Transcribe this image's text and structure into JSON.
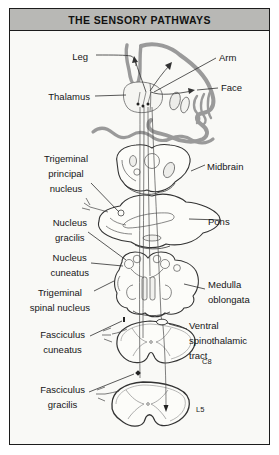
{
  "title": "THE SENSORY PATHWAYS",
  "labels": {
    "leg": "Leg",
    "arm": "Arm",
    "face": "Face",
    "thalamus": "Thalamus",
    "trigeminal_principal_nucleus": [
      "Trigeminal",
      "principal",
      "nucleus"
    ],
    "midbrain": "Midbrain",
    "nucleus_gracilis": [
      "Nucleus",
      "gracilis"
    ],
    "pons": "Pons",
    "nucleus_cuneatus": [
      "Nucleus",
      "cuneatus"
    ],
    "trigeminal_spinal_nucleus": [
      "Trigeminal",
      "spinal nucleus"
    ],
    "medulla_oblongata": [
      "Medulla",
      "oblongata"
    ],
    "fasciculus_cuneatus": [
      "Fasciculus",
      "cuneatus"
    ],
    "ventral_spinothalamic_tract": [
      "Ventral",
      "spinothalamic",
      "tract"
    ],
    "fasciculus_gracilis": [
      "Fasciculus",
      "gracilis"
    ],
    "c8": "C8",
    "l5": "L5"
  },
  "colors": {
    "title_bar_bg": "#b8b8b5",
    "frame_border": "#1c1c1c",
    "line_art_ink": "#333333",
    "cortex_gray": "#9a9a9a",
    "panel_bg": "#f9f9f6"
  }
}
